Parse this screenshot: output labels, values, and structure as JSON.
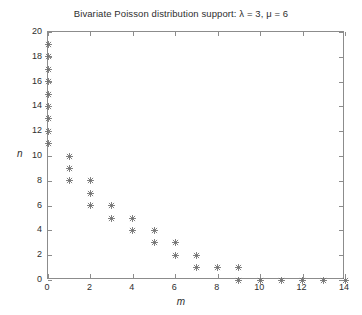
{
  "chart_data": {
    "type": "scatter",
    "title": "Bivariate Poisson distribution support: λ = 3, μ = 6",
    "xlabel": "m",
    "ylabel": "n",
    "xlim": [
      0,
      14
    ],
    "ylim": [
      0,
      20
    ],
    "xticks": [
      0,
      2,
      4,
      6,
      8,
      10,
      12,
      14
    ],
    "xticklabels": [
      "0",
      "2",
      "4",
      "6",
      "8",
      "10",
      "12",
      "14"
    ],
    "yticks": [
      0,
      2,
      4,
      6,
      8,
      10,
      12,
      14,
      16,
      18,
      20
    ],
    "yticklabels": [
      "0",
      "2",
      "4",
      "6",
      "8",
      "10",
      "12",
      "14",
      "16",
      "18",
      "20"
    ],
    "grid": false,
    "legend": null,
    "marker": "asterisk",
    "marker_color": "#6e6e6e",
    "series": [
      {
        "name": "support",
        "points": [
          [
            0,
            19
          ],
          [
            0,
            18
          ],
          [
            0,
            17
          ],
          [
            0,
            16
          ],
          [
            0,
            15
          ],
          [
            0,
            14
          ],
          [
            0,
            13
          ],
          [
            0,
            12
          ],
          [
            0,
            11
          ],
          [
            1,
            10
          ],
          [
            1,
            9
          ],
          [
            1,
            8
          ],
          [
            2,
            8
          ],
          [
            2,
            7
          ],
          [
            2,
            6
          ],
          [
            3,
            6
          ],
          [
            3,
            5
          ],
          [
            4,
            5
          ],
          [
            4,
            4
          ],
          [
            5,
            4
          ],
          [
            5,
            3
          ],
          [
            6,
            3
          ],
          [
            6,
            2
          ],
          [
            7,
            2
          ],
          [
            7,
            1
          ],
          [
            8,
            1
          ],
          [
            9,
            1
          ],
          [
            9,
            0
          ],
          [
            10,
            0
          ],
          [
            11,
            0
          ],
          [
            12,
            0
          ],
          [
            13,
            0
          ],
          [
            14,
            0
          ]
        ]
      }
    ]
  },
  "figure": {
    "background": "#ffffff",
    "axis_color": "#8c8c8c",
    "text_color": "#2e2e2e"
  }
}
